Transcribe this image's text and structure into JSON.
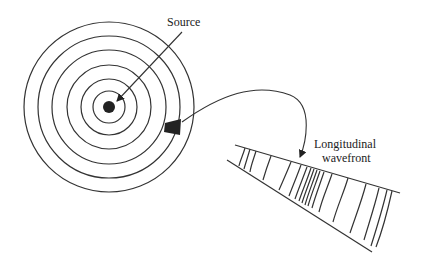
{
  "diagram": {
    "labels": {
      "source": "Source",
      "wavefront_line1": "Longitudinal",
      "wavefront_line2": "wavefront"
    },
    "concentric_circles": {
      "center": [
        109,
        107
      ],
      "radii": [
        85,
        71,
        57,
        42,
        28,
        16
      ],
      "source_dot_radius": 6
    },
    "colors": {
      "stroke": "#333333",
      "fill": "#222222",
      "background": "#ffffff"
    }
  }
}
